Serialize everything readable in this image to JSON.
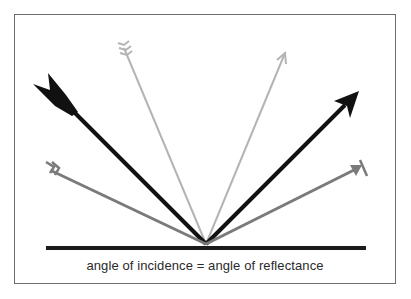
{
  "diagram": {
    "caption": "angle of incidence = angle of reflectance",
    "colors": {
      "frame": "#6d6d6d",
      "surface": "#1a1a1a",
      "black_arrow": "#111111",
      "light_gray_arrow": "#b4b4b4",
      "mid_gray_arrow": "#7a7a7a",
      "caption": "#2a2a2a"
    },
    "reflection_point": [
      206,
      244
    ],
    "surface": {
      "x1": 46,
      "x2": 366,
      "y": 248
    },
    "rays": [
      {
        "name": "steep-incident-light-gray",
        "from": [
          122,
          44
        ],
        "to": [
          206,
          244
        ],
        "style": "fletching"
      },
      {
        "name": "steep-reflected-light-gray",
        "from": [
          206,
          244
        ],
        "to": [
          285,
          52
        ],
        "style": "open-arrowhead"
      },
      {
        "name": "medium-incident-black",
        "from": [
          34,
          85
        ],
        "to": [
          206,
          244
        ],
        "style": "bold-fletching"
      },
      {
        "name": "medium-reflected-black",
        "from": [
          206,
          244
        ],
        "to": [
          358,
          92
        ],
        "style": "bold-arrowhead"
      },
      {
        "name": "shallow-incident-gray",
        "from": [
          44,
          164
        ],
        "to": [
          206,
          244
        ],
        "style": "fletching"
      },
      {
        "name": "shallow-reflected-gray",
        "from": [
          206,
          244
        ],
        "to": [
          366,
          163
        ],
        "style": "arrowhead-with-bar"
      }
    ]
  }
}
